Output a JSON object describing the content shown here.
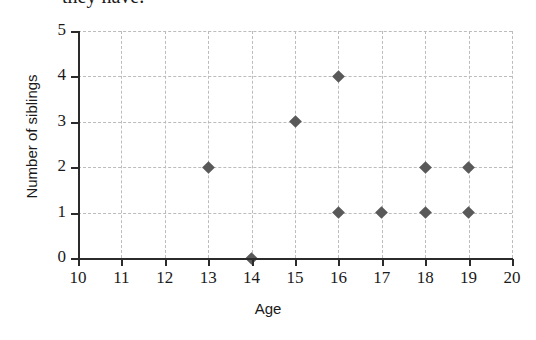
{
  "caption": {
    "text": "they have."
  },
  "chart_data": {
    "type": "scatter",
    "title": "",
    "xlabel": "Age",
    "ylabel": "Number of siblings",
    "xlim": [
      10,
      20
    ],
    "ylim": [
      0,
      5
    ],
    "xticks": [
      10,
      11,
      12,
      13,
      14,
      15,
      16,
      17,
      18,
      19,
      20
    ],
    "yticks": [
      0,
      1,
      2,
      3,
      4,
      5
    ],
    "xtick_labels": [
      "10",
      "11",
      "12",
      "13",
      "14",
      "15",
      "16",
      "17",
      "18",
      "19",
      "20"
    ],
    "ytick_labels": [
      "0",
      "1",
      "2",
      "3",
      "4",
      "5"
    ],
    "grid": true,
    "legend": "none",
    "marker": "diamond",
    "marker_color": "#595959",
    "axis_color": "#2b2b2b",
    "grid_color": "#bcbcbc",
    "background": "#ffffff",
    "points": [
      {
        "x": 13,
        "y": 2
      },
      {
        "x": 14,
        "y": 0
      },
      {
        "x": 15,
        "y": 3
      },
      {
        "x": 16,
        "y": 4
      },
      {
        "x": 16,
        "y": 1
      },
      {
        "x": 17,
        "y": 1
      },
      {
        "x": 18,
        "y": 2
      },
      {
        "x": 18,
        "y": 1
      },
      {
        "x": 19,
        "y": 2
      },
      {
        "x": 19,
        "y": 1
      }
    ]
  }
}
